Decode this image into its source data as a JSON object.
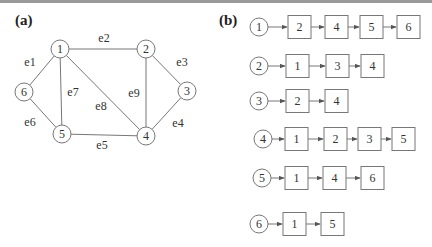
{
  "panels": {
    "a": {
      "label": "(a)"
    },
    "b": {
      "label": "(b)"
    }
  },
  "graph": {
    "nodes": [
      {
        "id": "1",
        "x": 60,
        "y": 49
      },
      {
        "id": "2",
        "x": 146,
        "y": 49
      },
      {
        "id": "3",
        "x": 187,
        "y": 91
      },
      {
        "id": "4",
        "x": 146,
        "y": 136
      },
      {
        "id": "5",
        "x": 62,
        "y": 134
      },
      {
        "id": "6",
        "x": 24,
        "y": 92
      }
    ],
    "edges": [
      {
        "label": "e1",
        "from": "1",
        "to": "6",
        "lx": 30,
        "ly": 66
      },
      {
        "label": "e2",
        "from": "1",
        "to": "2",
        "lx": 104,
        "ly": 42
      },
      {
        "label": "e3",
        "from": "2",
        "to": "3",
        "lx": 182,
        "ly": 66
      },
      {
        "label": "e4",
        "from": "3",
        "to": "4",
        "lx": 178,
        "ly": 127
      },
      {
        "label": "e5",
        "from": "5",
        "to": "4",
        "lx": 102,
        "ly": 149
      },
      {
        "label": "e6",
        "from": "6",
        "to": "5",
        "lx": 30,
        "ly": 126
      },
      {
        "label": "e7",
        "from": "1",
        "to": "5",
        "lx": 73,
        "ly": 96
      },
      {
        "label": "e8",
        "from": "1",
        "to": "4",
        "lx": 101,
        "ly": 110
      },
      {
        "label": "e9",
        "from": "2",
        "to": "4",
        "lx": 134,
        "ly": 97
      }
    ]
  },
  "adjacency_list": [
    {
      "vertex": "1",
      "neighbors": [
        "2",
        "4",
        "5",
        "6"
      ]
    },
    {
      "vertex": "2",
      "neighbors": [
        "1",
        "3",
        "4"
      ]
    },
    {
      "vertex": "3",
      "neighbors": [
        "2",
        "4"
      ]
    },
    {
      "vertex": "4",
      "neighbors": [
        "1",
        "2",
        "3",
        "5"
      ]
    },
    {
      "vertex": "5",
      "neighbors": [
        "1",
        "4",
        "6"
      ]
    },
    {
      "vertex": "6",
      "neighbors": [
        "1",
        "5"
      ]
    }
  ],
  "layout": {
    "rows": [
      {
        "cx": 259,
        "cy": 27,
        "boxes": [
          288,
          325,
          360,
          397
        ]
      },
      {
        "cx": 259,
        "cy": 66,
        "boxes": [
          286,
          326,
          361
        ]
      },
      {
        "cx": 259,
        "cy": 101,
        "boxes": [
          286,
          325
        ]
      },
      {
        "cx": 263,
        "cy": 139,
        "boxes": [
          285,
          324,
          358,
          392
        ]
      },
      {
        "cx": 262,
        "cy": 178,
        "boxes": [
          285,
          323,
          361
        ]
      },
      {
        "cx": 259,
        "cy": 224,
        "boxes": [
          283,
          321
        ]
      }
    ]
  }
}
